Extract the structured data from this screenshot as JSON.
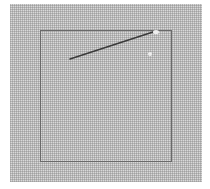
{
  "image": {
    "description": "Needle lying on embroidery canvas with a stitched square outline",
    "colors": {
      "canvas": "#d9d9d9",
      "outline": "#6a6a6a",
      "needle": "#3a3a3a"
    }
  }
}
